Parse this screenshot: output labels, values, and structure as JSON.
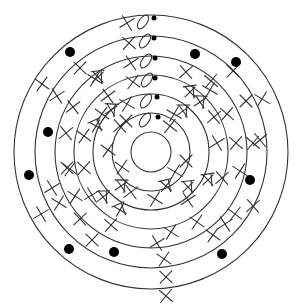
{
  "diagram": {
    "type": "concentric-rings",
    "center": [
      151,
      152
    ],
    "colors": {
      "stroke": "#333333",
      "dot": "#000000",
      "background": "#ffffff"
    },
    "rings": [
      {
        "id": "ring-1",
        "r": 20
      },
      {
        "id": "ring-2",
        "r": 39
      },
      {
        "id": "ring-3",
        "r": 58
      },
      {
        "id": "ring-4",
        "r": 77
      },
      {
        "id": "ring-5",
        "r": 96
      },
      {
        "id": "ring-6",
        "r": 116
      },
      {
        "id": "ring-7",
        "r": 137
      }
    ],
    "symbols": {
      "x_mark": "×",
      "crossed_box": "⊠",
      "oval": "0",
      "dot": "●"
    },
    "top_column": [
      {
        "x": 127,
        "y": 23,
        "oval_x": 143,
        "oval_y": 22,
        "dot_x": 154,
        "dot_y": 18
      },
      {
        "x": 129,
        "y": 43,
        "oval_x": 145,
        "oval_y": 41,
        "dot_x": 154,
        "dot_y": 38
      },
      {
        "x": 131,
        "y": 63,
        "oval_x": 146,
        "oval_y": 61,
        "dot_x": 155,
        "dot_y": 58
      },
      {
        "x": 133,
        "y": 82,
        "oval_x": 147,
        "oval_y": 80,
        "dot_x": 155,
        "dot_y": 78
      },
      {
        "x": 127,
        "y": 104,
        "oval_x": 146,
        "oval_y": 101,
        "dot_x": 157,
        "dot_y": 97
      },
      {
        "x": 126,
        "y": 121,
        "oval_x": 145,
        "oval_y": 120,
        "dot_x": 158,
        "dot_y": 117
      }
    ],
    "x_marks": [
      [
        42,
        84
      ],
      [
        57,
        96
      ],
      [
        80,
        68
      ],
      [
        73,
        107
      ],
      [
        95,
        79
      ],
      [
        108,
        96
      ],
      [
        66,
        133
      ],
      [
        84,
        136
      ],
      [
        67,
        168
      ],
      [
        84,
        168
      ],
      [
        41,
        214
      ],
      [
        59,
        203
      ],
      [
        75,
        196
      ],
      [
        80,
        219
      ],
      [
        92,
        240
      ],
      [
        70,
        169
      ],
      [
        233,
        71
      ],
      [
        211,
        81
      ],
      [
        186,
        72
      ],
      [
        210,
        90
      ],
      [
        227,
        114
      ],
      [
        246,
        101
      ],
      [
        262,
        99
      ],
      [
        260,
        140
      ],
      [
        217,
        143
      ],
      [
        236,
        143
      ],
      [
        253,
        143
      ],
      [
        222,
        178
      ],
      [
        240,
        171
      ],
      [
        253,
        206
      ],
      [
        235,
        214
      ],
      [
        225,
        224
      ],
      [
        213,
        235
      ],
      [
        197,
        222
      ],
      [
        188,
        200
      ],
      [
        171,
        232
      ],
      [
        157,
        243
      ],
      [
        164,
        259
      ],
      [
        166,
        277
      ],
      [
        166,
        296
      ],
      [
        120,
        126
      ],
      [
        170,
        126
      ],
      [
        122,
        167
      ],
      [
        175,
        172
      ],
      [
        131,
        192
      ],
      [
        155,
        199
      ],
      [
        174,
        114
      ],
      [
        108,
        150
      ],
      [
        186,
        161
      ],
      [
        52,
        188
      ],
      [
        111,
        225
      ],
      [
        92,
        195
      ],
      [
        102,
        114
      ],
      [
        214,
        117
      ]
    ],
    "crossed_marks": [
      [
        98,
        77
      ],
      [
        96,
        126
      ],
      [
        111,
        110
      ],
      [
        190,
        92
      ],
      [
        183,
        111
      ],
      [
        200,
        102
      ],
      [
        103,
        197
      ],
      [
        121,
        186
      ],
      [
        188,
        187
      ],
      [
        166,
        186
      ],
      [
        120,
        210
      ],
      [
        208,
        180
      ]
    ],
    "dots": [
      [
        70,
        52
      ],
      [
        48,
        132
      ],
      [
        29,
        175
      ],
      [
        69,
        249
      ],
      [
        114,
        252
      ],
      [
        195,
        54
      ],
      [
        236,
        62
      ],
      [
        250,
        180
      ],
      [
        222,
        254
      ]
    ]
  }
}
